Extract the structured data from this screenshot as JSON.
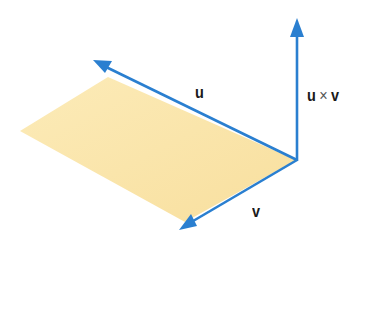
{
  "diagram": {
    "type": "vector-cross-product",
    "labels": {
      "u": "u",
      "v": "v",
      "cross_left": "u",
      "cross_op": "×",
      "cross_right": "v"
    },
    "colors": {
      "arrow": "#2a7fd0",
      "plane": "#fbe7b0",
      "text": "#1a1a1a"
    }
  }
}
